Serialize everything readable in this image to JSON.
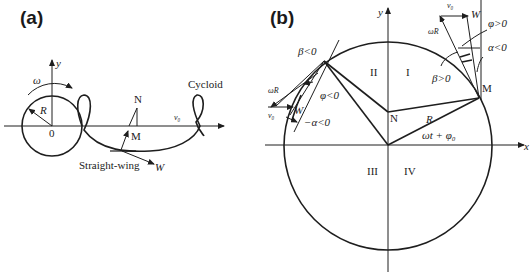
{
  "panels": [
    {
      "id": "a",
      "label": "(a)",
      "axes": {
        "x_origin_label": "0",
        "y_label": "y"
      },
      "labels": {
        "omega": "ω",
        "radius": "R",
        "point_n": "N",
        "point_m": "M",
        "velocity": "v₀",
        "cycloid": "Cycloid",
        "straight_wing": "Straight-wing",
        "w": "W"
      }
    },
    {
      "id": "b",
      "label": "(b)",
      "axes": {
        "x_label": "x",
        "y_label": "y"
      },
      "quadrants": [
        "I",
        "II",
        "III",
        "IV"
      ],
      "labels": {
        "point_n": "N",
        "point_m": "M",
        "radius": "R",
        "angle": "ωt + φ₀",
        "beta_neg": "β<0",
        "beta_pos": "β>0",
        "phi_neg": "φ<0",
        "phi_pos": "φ>0",
        "alpha_neg_left": "−α<0",
        "alpha_neg_right": "α<0",
        "omega_r_left": "ωR",
        "omega_r_right": "ωR",
        "v0_left": "v₀",
        "v0_right": "v₀",
        "w_left": "W",
        "w_right": "W"
      }
    }
  ]
}
